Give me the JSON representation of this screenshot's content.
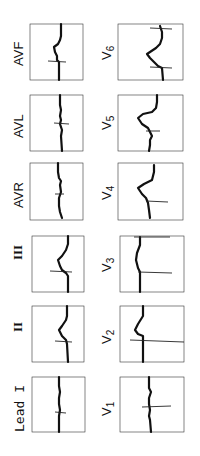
{
  "figure": {
    "orientation_deg": -90,
    "grid_color": "#555555",
    "trace_color": "#111111",
    "background": "#ffffff"
  },
  "columns": [
    {
      "name": "limb-leads",
      "leads": [
        {
          "id": "avf",
          "label": "AVF",
          "sub": ""
        },
        {
          "id": "avl",
          "label": "AVL",
          "sub": ""
        },
        {
          "id": "avr",
          "label": "AVR",
          "sub": ""
        },
        {
          "id": "iii",
          "label": "III",
          "sub": ""
        },
        {
          "id": "ii",
          "label": "II",
          "sub": ""
        },
        {
          "id": "i",
          "label": "Lead I",
          "sub": ""
        }
      ]
    },
    {
      "name": "precordial-leads",
      "leads": [
        {
          "id": "v6",
          "label": "V",
          "sub": "6"
        },
        {
          "id": "v5",
          "label": "V",
          "sub": "5"
        },
        {
          "id": "v4",
          "label": "V",
          "sub": "4"
        },
        {
          "id": "v3",
          "label": "V",
          "sub": "3"
        },
        {
          "id": "v2",
          "label": "V",
          "sub": "2"
        },
        {
          "id": "v1",
          "label": "V",
          "sub": "1"
        }
      ]
    }
  ]
}
